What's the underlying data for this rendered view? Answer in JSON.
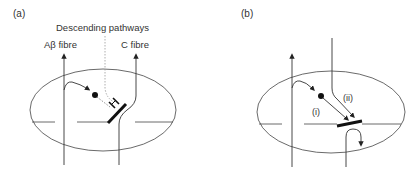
{
  "panels": [
    {
      "id": "a",
      "label": "(a)",
      "annotations": {
        "descending": "Descending pathways",
        "abeta": "Aβ fibre",
        "cfibre": "C fibre"
      }
    },
    {
      "id": "b",
      "label": "(b)",
      "annotations": {
        "path_i": "(i)",
        "path_ii": "(ii)"
      }
    }
  ],
  "colors": {
    "line": "#333333",
    "dotted": "#999999",
    "background": "#ffffff"
  }
}
